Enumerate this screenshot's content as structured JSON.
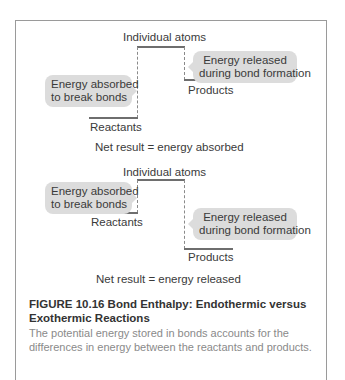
{
  "diagrams": [
    {
      "type": "endothermic",
      "atoms_label": "Individual atoms",
      "absorbed_label_line1": "Energy absorbed",
      "absorbed_label_line2": "to break bonds",
      "released_label_line1": "Energy released",
      "released_label_line2": "during bond formation",
      "reactants_label": "Reactants",
      "products_label": "Products",
      "net_result": "Net result = energy absorbed"
    },
    {
      "type": "exothermic",
      "atoms_label": "Individual atoms",
      "absorbed_label_line1": "Energy absorbed",
      "absorbed_label_line2": "to break bonds",
      "released_label_line1": "Energy released",
      "released_label_line2": "during bond formation",
      "reactants_label": "Reactants",
      "products_label": "Products",
      "net_result": "Net result = energy released"
    }
  ],
  "caption": {
    "title": "FIGURE 10.16  Bond Enthalpy: Endothermic versus Exothermic Reactions",
    "body": "The potential energy stored in bonds accounts for the differences in energy between the reactants and products."
  },
  "colors": {
    "bubble": "#dcdcdc",
    "line": "#6e6e6e",
    "caption_body": "#8a8a8a",
    "frame": "#9a9a9a"
  }
}
